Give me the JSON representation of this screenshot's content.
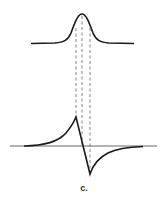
{
  "figure": {
    "label": "c.",
    "colors": {
      "curve": "#1a1a1a",
      "baseline": "#555555",
      "dashed": "#666666",
      "background": "#ffffff"
    },
    "upper_curve": {
      "shape": "absorption peak (Lorentzian/Gaussian)",
      "peak": [
        82,
        14
      ],
      "baseline_y": 43,
      "x_range": [
        31,
        134
      ]
    },
    "lower_curve": {
      "shape": "derivative (dispersion) signal",
      "max": [
        76,
        117
      ],
      "zero_cross": [
        82,
        145
      ],
      "min": [
        90,
        174
      ],
      "baseline_y": 146,
      "x_range": [
        10,
        157
      ]
    },
    "dashed_guides_x": [
      76,
      82,
      90
    ]
  }
}
